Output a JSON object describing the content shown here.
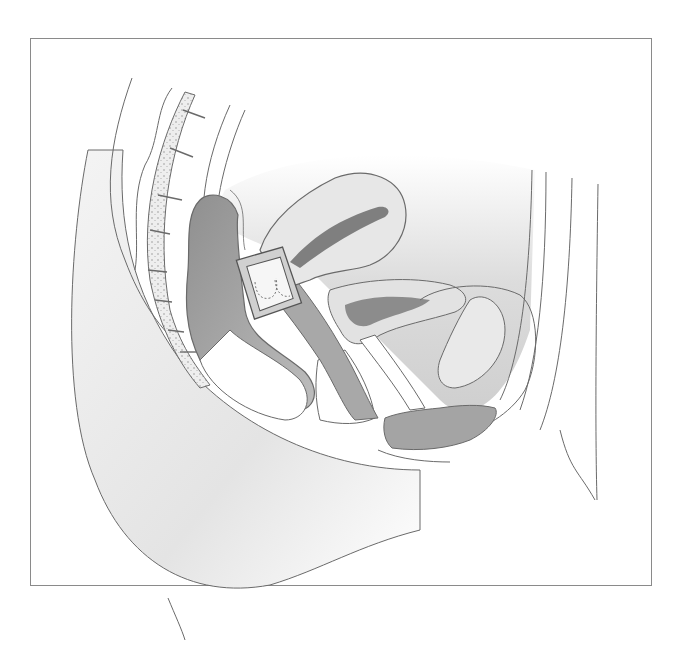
{
  "figure": {
    "type": "anatomical-illustration",
    "style": "grayscale line drawing",
    "colors": {
      "background": "#ffffff",
      "frame": "#8a8a8a",
      "outline": "#555555",
      "tissue_light": "#ececec",
      "tissue_mid": "#c9c9c9",
      "tissue_dark": "#9e9e9e",
      "bone_fill": "#e6e6e6"
    },
    "labels": []
  }
}
